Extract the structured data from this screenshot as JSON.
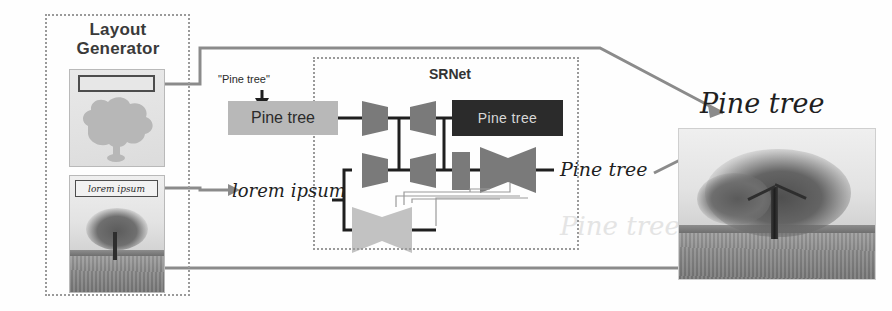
{
  "figure": {
    "background": "#ffffff"
  },
  "layout_generator": {
    "title_line1": "Layout",
    "title_line2": "Generator",
    "panel_a": {
      "name": "semantic-layout-panel",
      "text_box_value": ""
    },
    "panel_b": {
      "name": "source-image-panel",
      "text_box_value": "lorem ipsum"
    }
  },
  "pipeline": {
    "style_prompt": "\"Pine tree\"",
    "source_text_label": "lorem ipsum",
    "input_text_box": "Pine tree",
    "skeleton_text_box": "Pine tree",
    "output_text_label": "Pine tree"
  },
  "srnet": {
    "title": "SRNet",
    "blocks": [
      {
        "id": "enc-top-1",
        "role": "encoder",
        "shade": "mid"
      },
      {
        "id": "dec-top-1",
        "role": "decoder",
        "shade": "mid"
      },
      {
        "id": "enc-mid-1",
        "role": "encoder",
        "shade": "mid"
      },
      {
        "id": "dec-mid-1",
        "role": "decoder",
        "shade": "mid"
      },
      {
        "id": "conv-mid",
        "role": "conv",
        "shade": "mid"
      },
      {
        "id": "enc-mid-2",
        "role": "encoder",
        "shade": "mid"
      },
      {
        "id": "dec-mid-2",
        "role": "decoder",
        "shade": "mid"
      },
      {
        "id": "enc-bot-1",
        "role": "encoder",
        "shade": "light"
      },
      {
        "id": "dec-bot-1",
        "role": "decoder",
        "shade": "light"
      }
    ]
  },
  "output": {
    "caption": "Pine tree"
  },
  "colors": {
    "dotted_border": "#9a9a9a",
    "block_mid": "#7a7a7a",
    "block_light": "#c2c2c2",
    "wire": "#1f1f1f",
    "arrow_grey": "#8b8b8b",
    "dark_box": "#2b2b2b",
    "grey_box": "#b8b8b8"
  }
}
